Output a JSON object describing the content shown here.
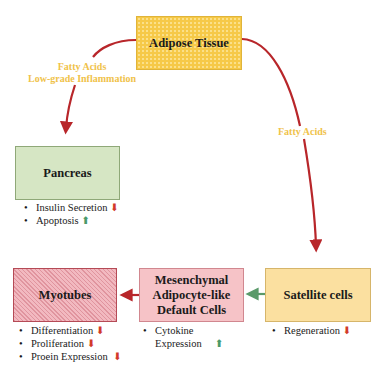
{
  "diagram": {
    "nodes": {
      "adipose": {
        "title": "Adipose Tissue"
      },
      "pancreas": {
        "title": "Pancreas",
        "effects": [
          {
            "text": "Insulin Secretion",
            "direction": "down",
            "glyph": "⬇"
          },
          {
            "text": "Apoptosis",
            "direction": "up",
            "glyph": "⬆"
          }
        ]
      },
      "myotubes": {
        "title": "Myotubes",
        "effects": [
          {
            "text": "Differentiation",
            "direction": "down",
            "glyph": "⬇"
          },
          {
            "text": "Proliferation",
            "direction": "down",
            "glyph": "⬇"
          },
          {
            "text": "Proein Expression",
            "direction": "down",
            "glyph": "⬇"
          }
        ]
      },
      "mesenchymal": {
        "title_lines": [
          "Mesenchymal",
          "Adipocyte-like",
          "Default Cells"
        ],
        "effects": [
          {
            "text_lines": [
              "Cytokine",
              "Expression"
            ],
            "direction": "up",
            "glyph": "⬆"
          }
        ]
      },
      "satellite": {
        "title": "Satellite cells",
        "effects": [
          {
            "text": "Regeneration",
            "direction": "down",
            "glyph": "⬇"
          }
        ]
      }
    },
    "edge_labels": {
      "adipose_to_pancreas": [
        "Fatty Acids",
        "Low-grade Inflammation"
      ],
      "adipose_to_satellite": "Fatty Acids"
    },
    "colors": {
      "arrow_red": "#b8262a",
      "arrow_green": "#5a9a6a",
      "label_yellow": "#f0c24a",
      "down": "#d23a2a",
      "up": "#4a9a6a"
    }
  }
}
